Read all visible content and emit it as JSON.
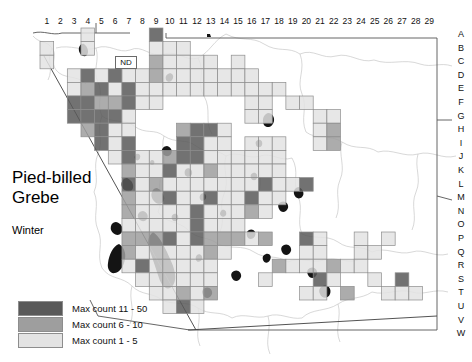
{
  "figure": {
    "species_title": "Pied-billed Grebe",
    "season": "Winter",
    "state_label": "ND"
  },
  "axes": {
    "columns": [
      "1",
      "2",
      "3",
      "4",
      "5",
      "6",
      "7",
      "8",
      "9",
      "10",
      "11",
      "12",
      "13",
      "14",
      "15",
      "16",
      "17",
      "18",
      "19",
      "20",
      "21",
      "22",
      "23",
      "24",
      "25",
      "26",
      "27",
      "28",
      "29"
    ],
    "rows": [
      "A",
      "B",
      "C",
      "D",
      "E",
      "F",
      "G",
      "H",
      "I",
      "J",
      "K",
      "L",
      "M",
      "N",
      "O",
      "P",
      "Q",
      "R",
      "S",
      "T",
      "U",
      "V",
      "W"
    ]
  },
  "legend": {
    "items": [
      {
        "label": "Max count 11 - 50",
        "color": "#595959",
        "level": 3
      },
      {
        "label": "Max count 6 - 10",
        "color": "#9e9e9e",
        "level": 2
      },
      {
        "label": "Max count 1 - 5",
        "color": "#e3e3e3",
        "level": 1
      }
    ]
  },
  "colors": {
    "level3": "#595959",
    "level2": "#9e9e9e",
    "level1": "#e3e3e3",
    "cell_border": "#8d8d8d",
    "boundary": "#4a4a4a",
    "river": "#b9b9b9",
    "water_body": "#1a1a1a"
  },
  "grid_geometry": {
    "origin_x": 40,
    "origin_y": 28,
    "cell_w": 13.66,
    "cell_h": 13.6,
    "n_cols": 29,
    "n_rows": 23
  },
  "chart_data": {
    "type": "heatmap",
    "title": "Pied-billed Grebe",
    "subtitle": "Winter",
    "xlabel": "",
    "ylabel": "",
    "x_ticks": [
      "1",
      "2",
      "3",
      "4",
      "5",
      "6",
      "7",
      "8",
      "9",
      "10",
      "11",
      "12",
      "13",
      "14",
      "15",
      "16",
      "17",
      "18",
      "19",
      "20",
      "21",
      "22",
      "23",
      "24",
      "25",
      "26",
      "27",
      "28",
      "29"
    ],
    "y_ticks": [
      "A",
      "B",
      "C",
      "D",
      "E",
      "F",
      "G",
      "H",
      "I",
      "J",
      "K",
      "L",
      "M",
      "N",
      "O",
      "P",
      "Q",
      "R",
      "S",
      "T",
      "U",
      "V",
      "W"
    ],
    "legend_position": "bottom-left",
    "grid": true,
    "value_levels": [
      {
        "level": 1,
        "range": "1 - 5",
        "color": "#e3e3e3"
      },
      {
        "level": 2,
        "range": "6 - 10",
        "color": "#9e9e9e"
      },
      {
        "level": 3,
        "range": "11 - 50",
        "color": "#595959"
      }
    ],
    "cells": [
      {
        "col": 1,
        "row": "B",
        "level": 1
      },
      {
        "col": 1,
        "row": "C",
        "level": 1
      },
      {
        "col": 4,
        "row": "A",
        "level": 1
      },
      {
        "col": 4,
        "row": "B",
        "level": 1
      },
      {
        "col": 9,
        "row": "A",
        "level": 3
      },
      {
        "col": 9,
        "row": "B",
        "level": 1
      },
      {
        "col": 10,
        "row": "B",
        "level": 1
      },
      {
        "col": 11,
        "row": "B",
        "level": 1
      },
      {
        "col": 9,
        "row": "C",
        "level": 2
      },
      {
        "col": 10,
        "row": "C",
        "level": 1
      },
      {
        "col": 11,
        "row": "C",
        "level": 1
      },
      {
        "col": 12,
        "row": "C",
        "level": 1
      },
      {
        "col": 13,
        "row": "C",
        "level": 1
      },
      {
        "col": 15,
        "row": "C",
        "level": 1
      },
      {
        "col": 3,
        "row": "D",
        "level": 1
      },
      {
        "col": 4,
        "row": "D",
        "level": 3
      },
      {
        "col": 5,
        "row": "D",
        "level": 1
      },
      {
        "col": 6,
        "row": "D",
        "level": 3
      },
      {
        "col": 7,
        "row": "D",
        "level": 1
      },
      {
        "col": 8,
        "row": "D",
        "level": 1
      },
      {
        "col": 9,
        "row": "D",
        "level": 2
      },
      {
        "col": 10,
        "row": "D",
        "level": 1
      },
      {
        "col": 11,
        "row": "D",
        "level": 1
      },
      {
        "col": 12,
        "row": "D",
        "level": 1
      },
      {
        "col": 13,
        "row": "D",
        "level": 1
      },
      {
        "col": 14,
        "row": "D",
        "level": 1
      },
      {
        "col": 15,
        "row": "D",
        "level": 1
      },
      {
        "col": 16,
        "row": "D",
        "level": 1
      },
      {
        "col": 3,
        "row": "E",
        "level": 1
      },
      {
        "col": 4,
        "row": "E",
        "level": 2
      },
      {
        "col": 5,
        "row": "E",
        "level": 3
      },
      {
        "col": 6,
        "row": "E",
        "level": 1
      },
      {
        "col": 7,
        "row": "E",
        "level": 3
      },
      {
        "col": 8,
        "row": "E",
        "level": 1
      },
      {
        "col": 9,
        "row": "E",
        "level": 1
      },
      {
        "col": 10,
        "row": "E",
        "level": 1
      },
      {
        "col": 11,
        "row": "E",
        "level": 1
      },
      {
        "col": 12,
        "row": "E",
        "level": 1
      },
      {
        "col": 13,
        "row": "E",
        "level": 1
      },
      {
        "col": 14,
        "row": "E",
        "level": 1
      },
      {
        "col": 15,
        "row": "E",
        "level": 1
      },
      {
        "col": 16,
        "row": "E",
        "level": 1
      },
      {
        "col": 17,
        "row": "E",
        "level": 1
      },
      {
        "col": 18,
        "row": "E",
        "level": 1
      },
      {
        "col": 3,
        "row": "F",
        "level": 3
      },
      {
        "col": 4,
        "row": "F",
        "level": 3
      },
      {
        "col": 5,
        "row": "F",
        "level": 2
      },
      {
        "col": 6,
        "row": "F",
        "level": 2
      },
      {
        "col": 7,
        "row": "F",
        "level": 3
      },
      {
        "col": 8,
        "row": "F",
        "level": 1
      },
      {
        "col": 9,
        "row": "F",
        "level": 1
      },
      {
        "col": 16,
        "row": "F",
        "level": 1
      },
      {
        "col": 17,
        "row": "F",
        "level": 1
      },
      {
        "col": 19,
        "row": "F",
        "level": 1
      },
      {
        "col": 20,
        "row": "F",
        "level": 1
      },
      {
        "col": 3,
        "row": "G",
        "level": 3
      },
      {
        "col": 4,
        "row": "G",
        "level": 3
      },
      {
        "col": 5,
        "row": "G",
        "level": 3
      },
      {
        "col": 6,
        "row": "G",
        "level": 3
      },
      {
        "col": 7,
        "row": "G",
        "level": 1
      },
      {
        "col": 16,
        "row": "G",
        "level": 1
      },
      {
        "col": 17,
        "row": "G",
        "level": 1
      },
      {
        "col": 21,
        "row": "G",
        "level": 1
      },
      {
        "col": 22,
        "row": "G",
        "level": 1
      },
      {
        "col": 4,
        "row": "H",
        "level": 2
      },
      {
        "col": 5,
        "row": "H",
        "level": 3
      },
      {
        "col": 6,
        "row": "H",
        "level": 1
      },
      {
        "col": 7,
        "row": "H",
        "level": 1
      },
      {
        "col": 11,
        "row": "H",
        "level": 2
      },
      {
        "col": 12,
        "row": "H",
        "level": 3
      },
      {
        "col": 13,
        "row": "H",
        "level": 3
      },
      {
        "col": 14,
        "row": "H",
        "level": 1
      },
      {
        "col": 21,
        "row": "H",
        "level": 1
      },
      {
        "col": 22,
        "row": "H",
        "level": 2
      },
      {
        "col": 5,
        "row": "I",
        "level": 3
      },
      {
        "col": 6,
        "row": "I",
        "level": 1
      },
      {
        "col": 7,
        "row": "I",
        "level": 3
      },
      {
        "col": 11,
        "row": "I",
        "level": 3
      },
      {
        "col": 12,
        "row": "I",
        "level": 3
      },
      {
        "col": 13,
        "row": "I",
        "level": 1
      },
      {
        "col": 14,
        "row": "I",
        "level": 1
      },
      {
        "col": 16,
        "row": "I",
        "level": 1
      },
      {
        "col": 17,
        "row": "I",
        "level": 1
      },
      {
        "col": 18,
        "row": "I",
        "level": 1
      },
      {
        "col": 21,
        "row": "I",
        "level": 1
      },
      {
        "col": 22,
        "row": "I",
        "level": 2
      },
      {
        "col": 6,
        "row": "J",
        "level": 1
      },
      {
        "col": 7,
        "row": "J",
        "level": 3
      },
      {
        "col": 8,
        "row": "J",
        "level": 1
      },
      {
        "col": 9,
        "row": "J",
        "level": 1
      },
      {
        "col": 10,
        "row": "J",
        "level": 2
      },
      {
        "col": 11,
        "row": "J",
        "level": 3
      },
      {
        "col": 12,
        "row": "J",
        "level": 3
      },
      {
        "col": 13,
        "row": "J",
        "level": 1
      },
      {
        "col": 14,
        "row": "J",
        "level": 1
      },
      {
        "col": 15,
        "row": "J",
        "level": 1
      },
      {
        "col": 16,
        "row": "J",
        "level": 1
      },
      {
        "col": 17,
        "row": "J",
        "level": 1
      },
      {
        "col": 18,
        "row": "J",
        "level": 1
      },
      {
        "col": 7,
        "row": "K",
        "level": 2
      },
      {
        "col": 8,
        "row": "K",
        "level": 1
      },
      {
        "col": 9,
        "row": "K",
        "level": 1
      },
      {
        "col": 10,
        "row": "K",
        "level": 3
      },
      {
        "col": 11,
        "row": "K",
        "level": 1
      },
      {
        "col": 12,
        "row": "K",
        "level": 1
      },
      {
        "col": 13,
        "row": "K",
        "level": 2
      },
      {
        "col": 14,
        "row": "K",
        "level": 1
      },
      {
        "col": 15,
        "row": "K",
        "level": 1
      },
      {
        "col": 16,
        "row": "K",
        "level": 1
      },
      {
        "col": 17,
        "row": "K",
        "level": 1
      },
      {
        "col": 18,
        "row": "K",
        "level": 1
      },
      {
        "col": 7,
        "row": "L",
        "level": 3
      },
      {
        "col": 8,
        "row": "L",
        "level": 1
      },
      {
        "col": 9,
        "row": "L",
        "level": 2
      },
      {
        "col": 10,
        "row": "L",
        "level": 1
      },
      {
        "col": 11,
        "row": "L",
        "level": 1
      },
      {
        "col": 12,
        "row": "L",
        "level": 1
      },
      {
        "col": 13,
        "row": "L",
        "level": 1
      },
      {
        "col": 14,
        "row": "L",
        "level": 1
      },
      {
        "col": 15,
        "row": "L",
        "level": 1
      },
      {
        "col": 16,
        "row": "L",
        "level": 1
      },
      {
        "col": 17,
        "row": "L",
        "level": 3
      },
      {
        "col": 18,
        "row": "L",
        "level": 1
      },
      {
        "col": 19,
        "row": "L",
        "level": 1
      },
      {
        "col": 20,
        "row": "L",
        "level": 3
      },
      {
        "col": 7,
        "row": "M",
        "level": 2
      },
      {
        "col": 8,
        "row": "M",
        "level": 1
      },
      {
        "col": 9,
        "row": "M",
        "level": 1
      },
      {
        "col": 10,
        "row": "M",
        "level": 3
      },
      {
        "col": 11,
        "row": "M",
        "level": 1
      },
      {
        "col": 12,
        "row": "M",
        "level": 1
      },
      {
        "col": 13,
        "row": "M",
        "level": 3
      },
      {
        "col": 14,
        "row": "M",
        "level": 1
      },
      {
        "col": 15,
        "row": "M",
        "level": 1
      },
      {
        "col": 16,
        "row": "M",
        "level": 3
      },
      {
        "col": 17,
        "row": "M",
        "level": 1
      },
      {
        "col": 18,
        "row": "M",
        "level": 1
      },
      {
        "col": 7,
        "row": "N",
        "level": 2
      },
      {
        "col": 8,
        "row": "N",
        "level": 1
      },
      {
        "col": 9,
        "row": "N",
        "level": 1
      },
      {
        "col": 10,
        "row": "N",
        "level": 1
      },
      {
        "col": 11,
        "row": "N",
        "level": 1
      },
      {
        "col": 12,
        "row": "N",
        "level": 3
      },
      {
        "col": 13,
        "row": "N",
        "level": 1
      },
      {
        "col": 14,
        "row": "N",
        "level": 1
      },
      {
        "col": 15,
        "row": "N",
        "level": 1
      },
      {
        "col": 16,
        "row": "N",
        "level": 2
      },
      {
        "col": 17,
        "row": "N",
        "level": 1
      },
      {
        "col": 7,
        "row": "O",
        "level": 1
      },
      {
        "col": 8,
        "row": "O",
        "level": 1
      },
      {
        "col": 9,
        "row": "O",
        "level": 1
      },
      {
        "col": 10,
        "row": "O",
        "level": 1
      },
      {
        "col": 11,
        "row": "O",
        "level": 1
      },
      {
        "col": 12,
        "row": "O",
        "level": 3
      },
      {
        "col": 13,
        "row": "O",
        "level": 1
      },
      {
        "col": 14,
        "row": "O",
        "level": 1
      },
      {
        "col": 15,
        "row": "O",
        "level": 1
      },
      {
        "col": 7,
        "row": "P",
        "level": 2
      },
      {
        "col": 8,
        "row": "P",
        "level": 2
      },
      {
        "col": 9,
        "row": "P",
        "level": 2
      },
      {
        "col": 10,
        "row": "P",
        "level": 3
      },
      {
        "col": 11,
        "row": "P",
        "level": 1
      },
      {
        "col": 12,
        "row": "P",
        "level": 3
      },
      {
        "col": 13,
        "row": "P",
        "level": 2
      },
      {
        "col": 14,
        "row": "P",
        "level": 2
      },
      {
        "col": 15,
        "row": "P",
        "level": 2
      },
      {
        "col": 16,
        "row": "P",
        "level": 1
      },
      {
        "col": 17,
        "row": "P",
        "level": 2
      },
      {
        "col": 20,
        "row": "P",
        "level": 3
      },
      {
        "col": 21,
        "row": "P",
        "level": 1
      },
      {
        "col": 24,
        "row": "P",
        "level": 1
      },
      {
        "col": 26,
        "row": "P",
        "level": 1
      },
      {
        "col": 7,
        "row": "Q",
        "level": 2
      },
      {
        "col": 8,
        "row": "Q",
        "level": 1
      },
      {
        "col": 9,
        "row": "Q",
        "level": 1
      },
      {
        "col": 10,
        "row": "Q",
        "level": 1
      },
      {
        "col": 11,
        "row": "Q",
        "level": 1
      },
      {
        "col": 12,
        "row": "Q",
        "level": 1
      },
      {
        "col": 13,
        "row": "Q",
        "level": 2
      },
      {
        "col": 14,
        "row": "Q",
        "level": 1
      },
      {
        "col": 20,
        "row": "Q",
        "level": 1
      },
      {
        "col": 21,
        "row": "Q",
        "level": 1
      },
      {
        "col": 24,
        "row": "Q",
        "level": 1
      },
      {
        "col": 25,
        "row": "Q",
        "level": 1
      },
      {
        "col": 7,
        "row": "R",
        "level": 1
      },
      {
        "col": 8,
        "row": "R",
        "level": 3
      },
      {
        "col": 9,
        "row": "R",
        "level": 1
      },
      {
        "col": 10,
        "row": "R",
        "level": 1
      },
      {
        "col": 11,
        "row": "R",
        "level": 1
      },
      {
        "col": 12,
        "row": "R",
        "level": 1
      },
      {
        "col": 13,
        "row": "R",
        "level": 1
      },
      {
        "col": 18,
        "row": "R",
        "level": 2
      },
      {
        "col": 19,
        "row": "R",
        "level": 1
      },
      {
        "col": 20,
        "row": "R",
        "level": 1
      },
      {
        "col": 21,
        "row": "R",
        "level": 1
      },
      {
        "col": 22,
        "row": "R",
        "level": 2
      },
      {
        "col": 23,
        "row": "R",
        "level": 1
      },
      {
        "col": 24,
        "row": "R",
        "level": 1
      },
      {
        "col": 8,
        "row": "S",
        "level": 1
      },
      {
        "col": 9,
        "row": "S",
        "level": 1
      },
      {
        "col": 10,
        "row": "S",
        "level": 1
      },
      {
        "col": 11,
        "row": "S",
        "level": 1
      },
      {
        "col": 12,
        "row": "S",
        "level": 1
      },
      {
        "col": 13,
        "row": "S",
        "level": 1
      },
      {
        "col": 17,
        "row": "S",
        "level": 1
      },
      {
        "col": 21,
        "row": "S",
        "level": 3
      },
      {
        "col": 22,
        "row": "S",
        "level": 1
      },
      {
        "col": 25,
        "row": "S",
        "level": 1
      },
      {
        "col": 27,
        "row": "S",
        "level": 3
      },
      {
        "col": 9,
        "row": "T",
        "level": 1
      },
      {
        "col": 10,
        "row": "T",
        "level": 1
      },
      {
        "col": 11,
        "row": "T",
        "level": 2
      },
      {
        "col": 12,
        "row": "T",
        "level": 1
      },
      {
        "col": 13,
        "row": "T",
        "level": 2
      },
      {
        "col": 20,
        "row": "T",
        "level": 1
      },
      {
        "col": 21,
        "row": "T",
        "level": 1
      },
      {
        "col": 23,
        "row": "T",
        "level": 2
      },
      {
        "col": 26,
        "row": "T",
        "level": 1
      },
      {
        "col": 27,
        "row": "T",
        "level": 1
      },
      {
        "col": 28,
        "row": "T",
        "level": 1
      },
      {
        "col": 10,
        "row": "U",
        "level": 1
      },
      {
        "col": 11,
        "row": "U",
        "level": 3
      },
      {
        "col": 12,
        "row": "U",
        "level": 1
      }
    ]
  }
}
